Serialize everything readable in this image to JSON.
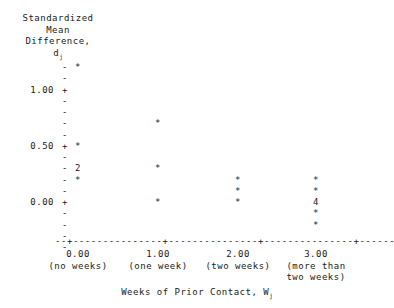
{
  "figure": {
    "kind": "ascii-scatter-plot",
    "background_color": "#ffffff",
    "text_color": "#1a1a1a"
  },
  "yaxis": {
    "title_lines": [
      "Standardized",
      "Mean",
      "Difference,",
      "d"
    ],
    "title_subscript": "j",
    "tick_labels": [
      "1.00",
      "0.50",
      "0.00"
    ],
    "tick_values": [
      1.0,
      0.5,
      0.0
    ],
    "tick_symbol": "+",
    "minor_symbol": "-",
    "rows": [
      {
        "row": 0,
        "value": 1.2,
        "symbol": "-"
      },
      {
        "row": 1,
        "value": 1.1,
        "symbol": "-"
      },
      {
        "row": 2,
        "value": 1.0,
        "symbol": "+"
      },
      {
        "row": 3,
        "value": 0.9,
        "symbol": "-"
      },
      {
        "row": 4,
        "value": 0.8,
        "symbol": "-"
      },
      {
        "row": 5,
        "value": 0.7,
        "symbol": "-"
      },
      {
        "row": 6,
        "value": 0.6,
        "symbol": "-"
      },
      {
        "row": 7,
        "value": 0.5,
        "symbol": "+"
      },
      {
        "row": 8,
        "value": 0.4,
        "symbol": "-"
      },
      {
        "row": 9,
        "value": 0.3,
        "symbol": "-"
      },
      {
        "row": 10,
        "value": 0.2,
        "symbol": "-"
      },
      {
        "row": 11,
        "value": 0.1,
        "symbol": "-"
      },
      {
        "row": 12,
        "value": 0.0,
        "symbol": "+"
      },
      {
        "row": 13,
        "value": -0.1,
        "symbol": "-"
      },
      {
        "row": 14,
        "value": -0.2,
        "symbol": "-"
      },
      {
        "row": 15,
        "value": -0.3,
        "symbol": "-"
      },
      {
        "row": 16,
        "value": -0.4,
        "symbol": "-"
      }
    ]
  },
  "xaxis": {
    "title_text": "Weeks of Prior Contact, W",
    "title_subscript": "j",
    "axis_line": "--+---------------+---------------+---------------+------",
    "tick_symbol": "+",
    "ticks": [
      {
        "value": "0.00",
        "caption": [
          "(no weeks)"
        ]
      },
      {
        "value": "1.00",
        "caption": [
          "(one week)"
        ]
      },
      {
        "value": "2.00",
        "caption": [
          "(two weeks)"
        ]
      },
      {
        "value": "3.00",
        "caption": [
          "(more than",
          "two weeks)"
        ]
      }
    ]
  },
  "chart_data": {
    "type": "scatter",
    "xlabel": "Weeks of Prior Contact, Wj",
    "ylabel": "Standardized Mean Difference, dj",
    "xlim": [
      -0.35,
      3.45
    ],
    "ylim": [
      -0.45,
      1.25
    ],
    "grid": false,
    "legend": false,
    "marker_symbol": "*",
    "overplot_note": "A digit in place of '*' denotes that many coincident observations at that point.",
    "x_categories": [
      "0.00",
      "1.00",
      "2.00",
      "3.00"
    ],
    "x_category_captions": [
      "(no weeks)",
      "(one week)",
      "(two weeks)",
      "(more than two weeks)"
    ],
    "points": [
      {
        "x": 0,
        "y": 1.2,
        "label": "*",
        "count": 1
      },
      {
        "x": 0,
        "y": 0.5,
        "label": "*",
        "count": 1
      },
      {
        "x": 0,
        "y": 0.3,
        "label": "2",
        "count": 2
      },
      {
        "x": 0,
        "y": 0.2,
        "label": "*",
        "count": 1
      },
      {
        "x": 1,
        "y": 0.7,
        "label": "*",
        "count": 1
      },
      {
        "x": 1,
        "y": 0.3,
        "label": "*",
        "count": 1
      },
      {
        "x": 1,
        "y": 0.0,
        "label": "*",
        "count": 1
      },
      {
        "x": 2,
        "y": 0.2,
        "label": "*",
        "count": 1
      },
      {
        "x": 2,
        "y": 0.1,
        "label": "*",
        "count": 1
      },
      {
        "x": 2,
        "y": 0.0,
        "label": "*",
        "count": 1
      },
      {
        "x": 3,
        "y": 0.2,
        "label": "*",
        "count": 1
      },
      {
        "x": 3,
        "y": 0.1,
        "label": "*",
        "count": 1
      },
      {
        "x": 3,
        "y": 0.0,
        "label": "4",
        "count": 4
      },
      {
        "x": 3,
        "y": -0.1,
        "label": "*",
        "count": 1
      },
      {
        "x": 3,
        "y": -0.2,
        "label": "*",
        "count": 1
      }
    ],
    "series": [
      {
        "name": "Standardized mean difference by weeks of prior contact",
        "x": [
          0,
          0,
          0,
          0,
          1,
          1,
          1,
          2,
          2,
          2,
          3,
          3,
          3,
          3,
          3
        ],
        "y": [
          1.2,
          0.5,
          0.3,
          0.2,
          0.7,
          0.3,
          0.0,
          0.2,
          0.1,
          0.0,
          0.2,
          0.1,
          0.0,
          -0.1,
          -0.2
        ],
        "counts": [
          1,
          1,
          2,
          1,
          1,
          1,
          1,
          1,
          1,
          1,
          1,
          1,
          4,
          1,
          1
        ]
      }
    ]
  }
}
